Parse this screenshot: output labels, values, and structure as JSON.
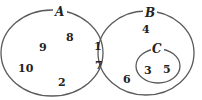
{
  "diagram": {
    "type": "venn",
    "colors": {
      "outline": "#5a5a5a",
      "text": "#222222",
      "background": "#ffffff"
    },
    "sets": [
      {
        "id": "A",
        "label": "A",
        "elements_only": [
          "9",
          "8",
          "10",
          "2"
        ]
      },
      {
        "id": "B",
        "label": "B",
        "elements_only": [
          "4",
          "6"
        ]
      },
      {
        "id": "C",
        "label": "C",
        "subset_of": "B",
        "elements": [
          "3",
          "5"
        ]
      }
    ],
    "intersection_A_B": [
      "1",
      "7"
    ],
    "elements": [
      {
        "value": "9",
        "region": "A only"
      },
      {
        "value": "8",
        "region": "A only"
      },
      {
        "value": "10",
        "region": "A only"
      },
      {
        "value": "2",
        "region": "A only"
      },
      {
        "value": "1",
        "region": "A and B"
      },
      {
        "value": "7",
        "region": "A and B"
      },
      {
        "value": "4",
        "region": "B only"
      },
      {
        "value": "6",
        "region": "B only"
      },
      {
        "value": "3",
        "region": "C (inside B)"
      },
      {
        "value": "5",
        "region": "C (inside B)"
      }
    ]
  }
}
